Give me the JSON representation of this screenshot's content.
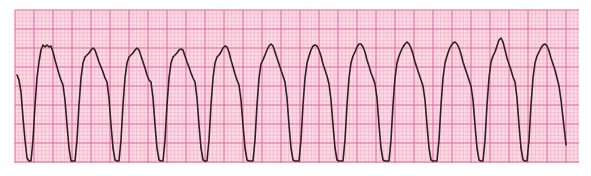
{
  "strip": {
    "paper_x": 15,
    "paper_y": 10,
    "paper_width": 564,
    "paper_height": 153,
    "small_square_px": 3.8,
    "big_square_every": 5,
    "colors": {
      "paper": "#fbdbe5",
      "minor_grid": "#f2a6c0",
      "major_grid": "#e2588f",
      "trace": "#2a2024",
      "page": "#ffffff"
    }
  },
  "trace": {
    "points": [
      [
        17,
        75
      ],
      [
        19,
        80
      ],
      [
        21,
        92
      ],
      [
        23,
        118
      ],
      [
        25,
        140
      ],
      [
        27,
        158
      ],
      [
        29,
        161
      ],
      [
        31,
        161
      ],
      [
        33,
        140
      ],
      [
        35,
        105
      ],
      [
        37,
        78
      ],
      [
        39,
        62
      ],
      [
        41,
        50
      ],
      [
        43,
        45
      ],
      [
        45,
        47
      ],
      [
        47,
        45
      ],
      [
        49,
        47
      ],
      [
        51,
        46
      ],
      [
        53,
        52
      ],
      [
        55,
        60
      ],
      [
        57,
        67
      ],
      [
        59,
        74
      ],
      [
        61,
        80
      ],
      [
        63,
        85
      ],
      [
        65,
        100
      ],
      [
        67,
        125
      ],
      [
        69,
        148
      ],
      [
        71,
        161
      ],
      [
        73,
        161
      ],
      [
        75,
        161
      ],
      [
        77,
        140
      ],
      [
        79,
        105
      ],
      [
        81,
        78
      ],
      [
        83,
        63
      ],
      [
        85,
        57
      ],
      [
        87,
        55
      ],
      [
        89,
        53
      ],
      [
        91,
        50
      ],
      [
        93,
        48
      ],
      [
        95,
        50
      ],
      [
        97,
        56
      ],
      [
        99,
        62
      ],
      [
        101,
        67
      ],
      [
        103,
        72
      ],
      [
        105,
        78
      ],
      [
        107,
        82
      ],
      [
        109,
        98
      ],
      [
        111,
        125
      ],
      [
        113,
        148
      ],
      [
        115,
        160
      ],
      [
        117,
        161
      ],
      [
        119,
        161
      ],
      [
        121,
        140
      ],
      [
        123,
        105
      ],
      [
        125,
        78
      ],
      [
        127,
        63
      ],
      [
        129,
        57
      ],
      [
        131,
        55
      ],
      [
        133,
        53
      ],
      [
        135,
        50
      ],
      [
        137,
        48
      ],
      [
        139,
        50
      ],
      [
        141,
        56
      ],
      [
        143,
        62
      ],
      [
        145,
        68
      ],
      [
        147,
        75
      ],
      [
        149,
        80
      ],
      [
        151,
        82
      ],
      [
        153,
        98
      ],
      [
        155,
        125
      ],
      [
        157,
        148
      ],
      [
        159,
        160
      ],
      [
        161,
        161
      ],
      [
        163,
        161
      ],
      [
        165,
        140
      ],
      [
        167,
        105
      ],
      [
        169,
        78
      ],
      [
        171,
        63
      ],
      [
        173,
        57
      ],
      [
        175,
        55
      ],
      [
        177,
        53
      ],
      [
        179,
        50
      ],
      [
        181,
        49
      ],
      [
        183,
        50
      ],
      [
        185,
        56
      ],
      [
        187,
        62
      ],
      [
        189,
        67
      ],
      [
        191,
        73
      ],
      [
        193,
        78
      ],
      [
        195,
        82
      ],
      [
        197,
        98
      ],
      [
        199,
        125
      ],
      [
        201,
        148
      ],
      [
        203,
        160
      ],
      [
        205,
        161
      ],
      [
        207,
        161
      ],
      [
        209,
        140
      ],
      [
        211,
        105
      ],
      [
        213,
        78
      ],
      [
        215,
        63
      ],
      [
        217,
        57
      ],
      [
        219,
        55
      ],
      [
        221,
        52
      ],
      [
        223,
        48
      ],
      [
        225,
        46
      ],
      [
        227,
        47
      ],
      [
        229,
        52
      ],
      [
        231,
        60
      ],
      [
        233,
        67
      ],
      [
        235,
        74
      ],
      [
        237,
        80
      ],
      [
        239,
        85
      ],
      [
        241,
        100
      ],
      [
        243,
        125
      ],
      [
        245,
        148
      ],
      [
        247,
        160
      ],
      [
        249,
        161
      ],
      [
        251,
        161
      ],
      [
        253,
        161
      ],
      [
        255,
        140
      ],
      [
        257,
        105
      ],
      [
        259,
        78
      ],
      [
        261,
        64
      ],
      [
        263,
        60
      ],
      [
        265,
        55
      ],
      [
        267,
        50
      ],
      [
        269,
        46
      ],
      [
        271,
        44
      ],
      [
        273,
        46
      ],
      [
        275,
        52
      ],
      [
        277,
        58
      ],
      [
        279,
        64
      ],
      [
        281,
        70
      ],
      [
        283,
        76
      ],
      [
        285,
        82
      ],
      [
        287,
        98
      ],
      [
        289,
        125
      ],
      [
        291,
        148
      ],
      [
        293,
        160
      ],
      [
        295,
        161
      ],
      [
        297,
        161
      ],
      [
        299,
        161
      ],
      [
        301,
        140
      ],
      [
        303,
        105
      ],
      [
        305,
        78
      ],
      [
        307,
        63
      ],
      [
        309,
        56
      ],
      [
        311,
        50
      ],
      [
        313,
        46
      ],
      [
        315,
        45
      ],
      [
        317,
        46
      ],
      [
        319,
        50
      ],
      [
        321,
        56
      ],
      [
        323,
        64
      ],
      [
        325,
        70
      ],
      [
        327,
        76
      ],
      [
        329,
        84
      ],
      [
        331,
        100
      ],
      [
        333,
        125
      ],
      [
        335,
        148
      ],
      [
        337,
        160
      ],
      [
        339,
        161
      ],
      [
        341,
        161
      ],
      [
        343,
        161
      ],
      [
        345,
        140
      ],
      [
        347,
        105
      ],
      [
        349,
        78
      ],
      [
        351,
        63
      ],
      [
        353,
        56
      ],
      [
        355,
        52
      ],
      [
        357,
        47
      ],
      [
        359,
        44
      ],
      [
        361,
        44
      ],
      [
        363,
        47
      ],
      [
        365,
        52
      ],
      [
        367,
        60
      ],
      [
        369,
        66
      ],
      [
        371,
        73
      ],
      [
        373,
        78
      ],
      [
        375,
        84
      ],
      [
        377,
        98
      ],
      [
        379,
        125
      ],
      [
        381,
        148
      ],
      [
        383,
        160
      ],
      [
        385,
        161
      ],
      [
        387,
        161
      ],
      [
        389,
        161
      ],
      [
        391,
        140
      ],
      [
        393,
        105
      ],
      [
        395,
        78
      ],
      [
        397,
        63
      ],
      [
        399,
        56
      ],
      [
        401,
        51
      ],
      [
        403,
        47
      ],
      [
        405,
        44
      ],
      [
        407,
        42
      ],
      [
        409,
        44
      ],
      [
        411,
        48
      ],
      [
        413,
        54
      ],
      [
        415,
        62
      ],
      [
        417,
        68
      ],
      [
        419,
        74
      ],
      [
        421,
        80
      ],
      [
        423,
        86
      ],
      [
        425,
        100
      ],
      [
        427,
        125
      ],
      [
        429,
        148
      ],
      [
        431,
        160
      ],
      [
        433,
        161
      ],
      [
        435,
        161
      ],
      [
        437,
        161
      ],
      [
        439,
        140
      ],
      [
        441,
        105
      ],
      [
        443,
        78
      ],
      [
        445,
        63
      ],
      [
        447,
        56
      ],
      [
        449,
        50
      ],
      [
        451,
        46
      ],
      [
        453,
        43
      ],
      [
        455,
        42
      ],
      [
        457,
        44
      ],
      [
        459,
        48
      ],
      [
        461,
        54
      ],
      [
        463,
        62
      ],
      [
        465,
        68
      ],
      [
        467,
        74
      ],
      [
        469,
        80
      ],
      [
        471,
        86
      ],
      [
        473,
        100
      ],
      [
        475,
        125
      ],
      [
        477,
        148
      ],
      [
        479,
        160
      ],
      [
        481,
        161
      ],
      [
        483,
        161
      ],
      [
        485,
        140
      ],
      [
        487,
        105
      ],
      [
        489,
        78
      ],
      [
        491,
        62
      ],
      [
        493,
        56
      ],
      [
        495,
        52
      ],
      [
        497,
        46
      ],
      [
        499,
        40
      ],
      [
        501,
        38
      ],
      [
        503,
        42
      ],
      [
        505,
        50
      ],
      [
        507,
        58
      ],
      [
        509,
        64
      ],
      [
        511,
        70
      ],
      [
        513,
        77
      ],
      [
        515,
        82
      ],
      [
        517,
        98
      ],
      [
        519,
        125
      ],
      [
        521,
        148
      ],
      [
        523,
        160
      ],
      [
        525,
        161
      ],
      [
        527,
        161
      ],
      [
        529,
        140
      ],
      [
        531,
        105
      ],
      [
        533,
        78
      ],
      [
        535,
        63
      ],
      [
        537,
        56
      ],
      [
        539,
        52
      ],
      [
        541,
        48
      ],
      [
        543,
        45
      ],
      [
        545,
        44
      ],
      [
        547,
        46
      ],
      [
        549,
        51
      ],
      [
        551,
        58
      ],
      [
        553,
        64
      ],
      [
        555,
        70
      ],
      [
        557,
        78
      ],
      [
        559,
        86
      ],
      [
        561,
        100
      ],
      [
        563,
        118
      ],
      [
        565,
        135
      ],
      [
        566,
        145
      ]
    ]
  }
}
